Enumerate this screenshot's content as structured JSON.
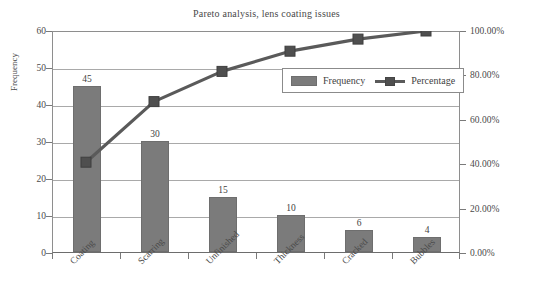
{
  "chart_data": {
    "type": "bar",
    "title": "Pareto analysis, lens coating issues",
    "xlabel": "",
    "ylabel": "Frequency",
    "ylabel_right": "",
    "categories": [
      "Coating",
      "Scarring",
      "Unfinished",
      "Thickness",
      "Cracked",
      "Bubbles"
    ],
    "series": [
      {
        "name": "Frequency",
        "type": "bar",
        "axis": "left",
        "values": [
          45,
          30,
          15,
          10,
          6,
          4
        ],
        "data_labels": [
          "45",
          "30",
          "15",
          "10",
          "6",
          "4"
        ],
        "color": "#7b7b7b"
      },
      {
        "name": "Percentage",
        "type": "line",
        "axis": "right",
        "values": [
          40.91,
          68.18,
          81.82,
          90.91,
          96.36,
          100.0
        ],
        "color": "#5a5a5a",
        "marker": "square"
      }
    ],
    "total_frequency": 110,
    "ylim": [
      0,
      60
    ],
    "yticks": [
      0,
      10,
      20,
      30,
      40,
      50,
      60
    ],
    "ytick_labels": [
      "0",
      "10",
      "20",
      "30",
      "40",
      "50",
      "60"
    ],
    "ylim_right": [
      0,
      100
    ],
    "yticks_right": [
      0,
      20,
      40,
      60,
      80,
      100
    ],
    "ytick_labels_right": [
      "0.00%",
      "20.00%",
      "40.00%",
      "60.00%",
      "80.00%",
      "100.00%"
    ],
    "grid": true,
    "grid_axis": "y",
    "legend_position": "upper-right-inside",
    "legend_entries": [
      "Frequency",
      "Percentage"
    ],
    "background": "#ffffff",
    "axis_color": "#8e8e8e",
    "gridline_color": "#a9a9a9"
  }
}
